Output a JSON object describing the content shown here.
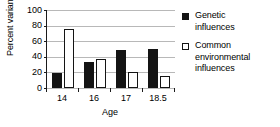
{
  "chart_data": {
    "type": "bar",
    "title": "",
    "xlabel": "Age",
    "ylabel": "Percent variance",
    "categories": [
      "14",
      "16",
      "17",
      "18.5"
    ],
    "series": [
      {
        "name": "Genetic influences",
        "values": [
          19,
          33,
          49,
          50
        ],
        "color": "#141414",
        "swatch": "filled"
      },
      {
        "name": "Common environmental influences",
        "values": [
          76,
          37,
          20,
          15
        ],
        "color": "#ffffff",
        "swatch": "open"
      }
    ],
    "ylim": [
      0,
      100
    ],
    "yticks": [
      0,
      20,
      40,
      60,
      80,
      100
    ],
    "ytick_labels": [
      "0",
      "20",
      "40",
      "60",
      "80",
      "100"
    ],
    "grid": true,
    "grid_axis": "y",
    "legend_position": "right"
  },
  "legend": {
    "entries": [
      {
        "label_line1": "Genetic",
        "label_line2": "influences",
        "label_line3": ""
      },
      {
        "label_line1": "Common",
        "label_line2": "environmental",
        "label_line3": "influences"
      }
    ]
  },
  "colors": {
    "genetic": "#141414",
    "common": "#ffffff",
    "axis": "#1a1a1a",
    "grid": "#b8b8b8",
    "background": "#ffffff"
  }
}
